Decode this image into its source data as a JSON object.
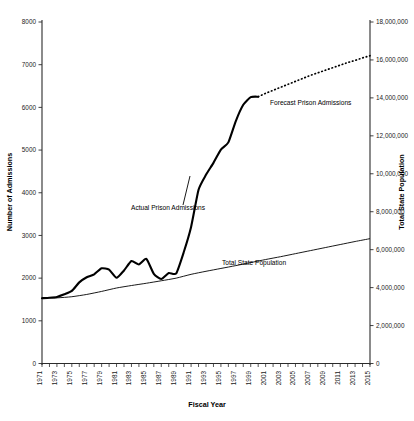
{
  "chart_data": {
    "type": "line",
    "title": "",
    "xlabel": "Fiscal Year",
    "ylabel": "Number of Admissions",
    "y2label": "Total State Population",
    "grid": false,
    "legend_position": "inline-annotations",
    "ylim": [
      0,
      8000
    ],
    "y2lim": [
      0,
      18000000
    ],
    "xlim": [
      1971,
      2015
    ],
    "y_ticks": [
      0,
      1000,
      2000,
      3000,
      4000,
      5000,
      6000,
      7000,
      8000
    ],
    "y_tick_labels": [
      "0",
      "1000",
      "2000",
      "3000",
      "4000",
      "5000",
      "6000",
      "7000",
      "8000"
    ],
    "y2_ticks": [
      0,
      2000000,
      4000000,
      6000000,
      8000000,
      10000000,
      12000000,
      14000000,
      16000000,
      18000000
    ],
    "y2_tick_labels": [
      "0",
      "2,000,000",
      "4,000,000",
      "6,000,000",
      "8,000,000",
      "10,000,000",
      "12,000,000",
      "14,000,000",
      "16,000,000",
      "18,000,000"
    ],
    "x_ticks": [
      1971,
      1972,
      1973,
      1974,
      1975,
      1976,
      1977,
      1978,
      1979,
      1980,
      1981,
      1982,
      1983,
      1984,
      1985,
      1986,
      1987,
      1988,
      1989,
      1990,
      1991,
      1992,
      1993,
      1994,
      1995,
      1996,
      1997,
      1998,
      1999,
      2000,
      2001,
      2002,
      2003,
      2004,
      2005,
      2006,
      2007,
      2008,
      2009,
      2010,
      2011,
      2012,
      2013,
      2014,
      2015
    ],
    "x_tick_labels": [
      "1971",
      "1973",
      "1975",
      "1977",
      "1979",
      "1981",
      "1983",
      "1985",
      "1987",
      "1989",
      "1991",
      "1993",
      "1995",
      "1997",
      "1999",
      "2001",
      "2003",
      "2005",
      "2007",
      "2009",
      "2011",
      "2013",
      "2015"
    ],
    "series": [
      {
        "name": "Actual Prison Admissions",
        "axis": "left",
        "style": "solid-thick",
        "annotation": "Actual Prison Admissions",
        "x": [
          1971,
          1972,
          1973,
          1974,
          1975,
          1976,
          1977,
          1978,
          1979,
          1980,
          1981,
          1982,
          1983,
          1984,
          1985,
          1986,
          1987,
          1988,
          1989,
          1990,
          1991,
          1992,
          1993,
          1994,
          1995,
          1996,
          1997,
          1998,
          1999,
          2000
        ],
        "values": [
          1530,
          1540,
          1560,
          1620,
          1700,
          1900,
          2020,
          2090,
          2230,
          2200,
          2010,
          2180,
          2400,
          2320,
          2450,
          2100,
          1980,
          2120,
          2110,
          2600,
          3200,
          4070,
          4420,
          4700,
          5010,
          5180,
          5680,
          6060,
          6240,
          6250
        ]
      },
      {
        "name": "Forecast Prison Admissions",
        "axis": "left",
        "style": "dotted",
        "annotation": "Forecast Prison Admissions",
        "x": [
          2000,
          2001,
          2002,
          2003,
          2004,
          2005,
          2006,
          2007,
          2008,
          2009,
          2010,
          2011,
          2012,
          2013,
          2014,
          2015
        ],
        "values": [
          6250,
          6330,
          6400,
          6470,
          6540,
          6610,
          6680,
          6750,
          6810,
          6870,
          6930,
          6990,
          7050,
          7100,
          7160,
          7210
        ]
      },
      {
        "name": "Total State Population",
        "axis": "right",
        "style": "solid-thin",
        "annotation": "Total State Population",
        "x": [
          1971,
          1973,
          1975,
          1977,
          1979,
          1981,
          1983,
          1985,
          1987,
          1989,
          1991,
          1993,
          1995,
          1997,
          1999,
          2001,
          2003,
          2005,
          2007,
          2009,
          2011,
          2013,
          2015
        ],
        "values": [
          3460000,
          3460000,
          3520000,
          3640000,
          3800000,
          3980000,
          4110000,
          4230000,
          4360000,
          4500000,
          4700000,
          4860000,
          5010000,
          5160000,
          5320000,
          5480000,
          5630000,
          5790000,
          5950000,
          6110000,
          6270000,
          6430000,
          6580000
        ]
      }
    ],
    "annotations": [
      {
        "text": "Actual Prison Admissions",
        "x": 1982.6,
        "y": 3560
      },
      {
        "text": "Forecast Prison Admissions",
        "x": 2003.5,
        "y": 5880
      },
      {
        "text": "Total State Population",
        "x": 1995.5,
        "y": 2300
      }
    ]
  }
}
